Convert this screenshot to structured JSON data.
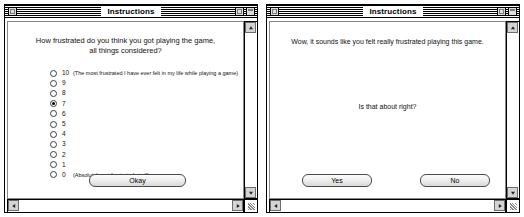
{
  "left_window": {
    "title": "Instructions",
    "controls": {
      "close": "close-box",
      "zoom": "zoom-box",
      "collapse": "collapse-box"
    },
    "prompt_line1": "How frustrated do you think you got playing the game,",
    "prompt_line2": "all things considered?",
    "selected_value": "7",
    "options": [
      {
        "value": "10",
        "note": "(The most frustrated I have ever felt in my life while playing a game)",
        "selected": false
      },
      {
        "value": "9",
        "note": "",
        "selected": false
      },
      {
        "value": "8",
        "note": "",
        "selected": false
      },
      {
        "value": "7",
        "note": "",
        "selected": true
      },
      {
        "value": "6",
        "note": "",
        "selected": false
      },
      {
        "value": "5",
        "note": "",
        "selected": false
      },
      {
        "value": "4",
        "note": "",
        "selected": false
      },
      {
        "value": "3",
        "note": "",
        "selected": false
      },
      {
        "value": "2",
        "note": "",
        "selected": false
      },
      {
        "value": "1",
        "note": "",
        "selected": false
      },
      {
        "value": "0",
        "note": "(Absolutely not frustrated at all)",
        "selected": false
      }
    ],
    "okay_label": "Okay"
  },
  "right_window": {
    "title": "Instructions",
    "message_top": "Wow, it sounds like you felt really frustrated playing this game.",
    "message_mid": "Is that about right?",
    "yes_label": "Yes",
    "no_label": "No"
  },
  "colors": {
    "window_bg": "#ffffff",
    "chrome": "#dcdcdc",
    "border": "#000000",
    "text": "#111111"
  }
}
